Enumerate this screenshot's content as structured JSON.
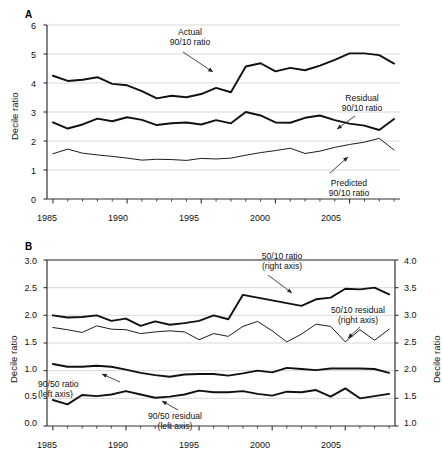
{
  "figure": {
    "panels": [
      {
        "letter": "A",
        "ylabel": "Decile ratio",
        "ylim": [
          0,
          6
        ],
        "yticks": [
          "0",
          "1",
          "2",
          "3",
          "4",
          "5",
          "6"
        ],
        "xlim": [
          1984.6,
          2008.4
        ],
        "xticks": [
          "1985",
          "1990",
          "1995",
          "2000",
          "2005"
        ],
        "annotations": [
          {
            "name": "actual-9010-label",
            "line1": "Actual",
            "line2": "90/10 ratio"
          },
          {
            "name": "residual-9010-label",
            "line1": "Residual",
            "line2": "90/10 ratio"
          },
          {
            "name": "predicted-9010-label",
            "line1": "Predicted",
            "line2": "90/10 ratio"
          }
        ]
      },
      {
        "letter": "B",
        "ylabel_left": "Decile ratio",
        "ylabel_right": "Decile ratio",
        "ylim_left": [
          0.0,
          3.0
        ],
        "ylim_right": [
          1.0,
          4.0
        ],
        "yticks_left": [
          "0.0",
          "0.5",
          "1.0",
          "1.5",
          "2.0",
          "2.5",
          "3.0"
        ],
        "yticks_right": [
          "1.0",
          "1.5",
          "2.0",
          "2.5",
          "3.0",
          "3.5",
          "4.0"
        ],
        "xlim": [
          1984.6,
          2008.4
        ],
        "xticks": [
          "1985",
          "1990",
          "1995",
          "2000",
          "2005"
        ],
        "annotations": [
          {
            "name": "ratio-5010-label",
            "line1": "50/10 ratio",
            "line2": "(right axis)"
          },
          {
            "name": "residual-5010-label",
            "line1": "50/10 residual",
            "line2": "(right axis)"
          },
          {
            "name": "ratio-9050-label",
            "line1": "90/50 ratio",
            "line2": "(left axis)"
          },
          {
            "name": "residual-9050-label",
            "line1": "90/50 residual",
            "line2": "(left axis)"
          }
        ]
      }
    ]
  },
  "chart_data": [
    {
      "type": "line",
      "panel": "A",
      "title": "",
      "xlabel": "",
      "ylabel": "Decile ratio",
      "xlim": [
        1984.6,
        2008.4
      ],
      "ylim": [
        0,
        6
      ],
      "grid": "horizontal",
      "legend": "annotations",
      "x": [
        1985,
        1986,
        1987,
        1988,
        1989,
        1990,
        1991,
        1992,
        1993,
        1994,
        1995,
        1996,
        1997,
        1998,
        1999,
        2000,
        2001,
        2002,
        2003,
        2004,
        2005,
        2006,
        2007,
        2008
      ],
      "series": [
        {
          "name": "Actual 90/10 ratio",
          "axis": "left",
          "style": "thick",
          "values": [
            4.25,
            4.07,
            4.11,
            4.2,
            3.97,
            3.92,
            3.72,
            3.47,
            3.56,
            3.51,
            3.62,
            3.83,
            3.68,
            4.57,
            4.68,
            4.4,
            4.52,
            4.44,
            4.6,
            4.8,
            5.02,
            5.02,
            4.96,
            4.67
          ]
        },
        {
          "name": "Residual 90/10 ratio",
          "axis": "left",
          "style": "thick",
          "values": [
            2.64,
            2.43,
            2.57,
            2.77,
            2.68,
            2.82,
            2.73,
            2.55,
            2.61,
            2.64,
            2.57,
            2.72,
            2.61,
            3.0,
            2.88,
            2.64,
            2.63,
            2.8,
            2.88,
            2.72,
            2.6,
            2.53,
            2.38,
            2.76
          ]
        },
        {
          "name": "Predicted 90/10 ratio",
          "axis": "left",
          "style": "thin",
          "values": [
            1.56,
            1.72,
            1.58,
            1.52,
            1.47,
            1.41,
            1.34,
            1.37,
            1.36,
            1.33,
            1.4,
            1.38,
            1.41,
            1.51,
            1.6,
            1.67,
            1.75,
            1.57,
            1.65,
            1.78,
            1.88,
            1.96,
            2.09,
            1.69
          ]
        }
      ]
    },
    {
      "type": "line",
      "panel": "B",
      "title": "",
      "xlabel": "",
      "ylabel_left": "Decile ratio",
      "ylabel_right": "Decile ratio",
      "xlim": [
        1984.6,
        2008.4
      ],
      "ylim_left": [
        0.0,
        3.0
      ],
      "ylim_right": [
        1.0,
        4.0
      ],
      "grid": "horizontal",
      "legend": "annotations",
      "x": [
        1985,
        1986,
        1987,
        1988,
        1989,
        1990,
        1991,
        1992,
        1993,
        1994,
        1995,
        1996,
        1997,
        1998,
        1999,
        2000,
        2001,
        2002,
        2003,
        2004,
        2005,
        2006,
        2007,
        2008
      ],
      "series": [
        {
          "name": "50/10 ratio",
          "axis": "right",
          "style": "thick",
          "values": [
            3.0,
            2.96,
            2.97,
            3.0,
            2.9,
            2.94,
            2.81,
            2.89,
            2.83,
            2.86,
            2.9,
            3.0,
            2.93,
            3.37,
            3.32,
            3.27,
            3.22,
            3.17,
            3.29,
            3.32,
            3.48,
            3.47,
            3.5,
            3.38
          ]
        },
        {
          "name": "50/10 residual",
          "axis": "right",
          "style": "thin",
          "values": [
            2.78,
            2.74,
            2.69,
            2.81,
            2.75,
            2.74,
            2.67,
            2.7,
            2.72,
            2.7,
            2.56,
            2.67,
            2.62,
            2.8,
            2.89,
            2.72,
            2.52,
            2.66,
            2.84,
            2.8,
            2.52,
            2.74,
            2.55,
            2.75
          ]
        },
        {
          "name": "90/50 ratio",
          "axis": "left",
          "style": "thick",
          "values": [
            1.12,
            1.07,
            1.07,
            1.09,
            1.07,
            1.02,
            0.96,
            0.92,
            0.89,
            0.93,
            0.94,
            0.94,
            0.91,
            0.95,
            1.0,
            0.97,
            1.05,
            1.03,
            1.01,
            1.04,
            1.04,
            1.04,
            1.03,
            0.96
          ]
        },
        {
          "name": "90/50 residual",
          "axis": "left",
          "style": "thick",
          "values": [
            0.47,
            0.39,
            0.56,
            0.54,
            0.57,
            0.63,
            0.57,
            0.51,
            0.53,
            0.57,
            0.64,
            0.61,
            0.61,
            0.63,
            0.58,
            0.55,
            0.62,
            0.61,
            0.65,
            0.53,
            0.68,
            0.5,
            0.54,
            0.58
          ]
        }
      ]
    }
  ]
}
